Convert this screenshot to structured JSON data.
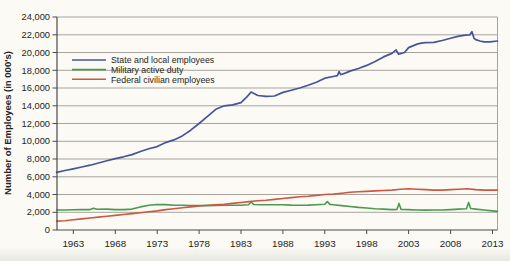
{
  "figure": {
    "title": "",
    "background": "#fbfaf5"
  },
  "chart_data": {
    "type": "line",
    "title": "",
    "xlabel": "",
    "ylabel": "Number of Employees (in 000's)",
    "xlim": [
      1961.05,
      2013.6
    ],
    "ylim": [
      0,
      24000
    ],
    "grid": "horizontal",
    "legend_position": "top-left-inside",
    "x_ticks": [
      1963,
      1968,
      1973,
      1978,
      1983,
      1988,
      1993,
      1998,
      2003,
      2008,
      2013
    ],
    "x_tick_labels": [
      "1963",
      "1968",
      "1973",
      "1978",
      "1983",
      "1988",
      "1993",
      "1998",
      "2003",
      "2008",
      "2013"
    ],
    "y_ticks": [
      0,
      2000,
      4000,
      6000,
      8000,
      10000,
      12000,
      14000,
      16000,
      18000,
      20000,
      22000,
      24000
    ],
    "y_tick_labels": [
      "0",
      "2,000",
      "4,000",
      "6,000",
      "8,000",
      "10,000",
      "12,000",
      "14,000",
      "16,000",
      "18,000",
      "20,000",
      "22,000",
      "24,000"
    ],
    "colors": {
      "grid": "#a8a49d",
      "axis": "#4a4a48",
      "text": "#262422"
    },
    "series": [
      {
        "name": "State and local employees",
        "color": "#47549a",
        "width": 1.7,
        "points": [
          [
            1961,
            6500
          ],
          [
            1962,
            6700
          ],
          [
            1963,
            6900
          ],
          [
            1964,
            7100
          ],
          [
            1965,
            7300
          ],
          [
            1966,
            7550
          ],
          [
            1967,
            7800
          ],
          [
            1968,
            8050
          ],
          [
            1969,
            8250
          ],
          [
            1970,
            8500
          ],
          [
            1971,
            8850
          ],
          [
            1972,
            9150
          ],
          [
            1973,
            9400
          ],
          [
            1974,
            9850
          ],
          [
            1975,
            10150
          ],
          [
            1976,
            10600
          ],
          [
            1977,
            11250
          ],
          [
            1978,
            12000
          ],
          [
            1979,
            12800
          ],
          [
            1980,
            13600
          ],
          [
            1981,
            14000
          ],
          [
            1982,
            14100
          ],
          [
            1983,
            14350
          ],
          [
            1983.7,
            15000
          ],
          [
            1984.2,
            15550
          ],
          [
            1985,
            15150
          ],
          [
            1986,
            15050
          ],
          [
            1987,
            15100
          ],
          [
            1988,
            15500
          ],
          [
            1989,
            15750
          ],
          [
            1990,
            16000
          ],
          [
            1991,
            16300
          ],
          [
            1992,
            16650
          ],
          [
            1993,
            17100
          ],
          [
            1994,
            17300
          ],
          [
            1994.5,
            17400
          ],
          [
            1994.7,
            17850
          ],
          [
            1994.9,
            17500
          ],
          [
            1995.5,
            17700
          ],
          [
            1996,
            17900
          ],
          [
            1997,
            18200
          ],
          [
            1998,
            18550
          ],
          [
            1999,
            19000
          ],
          [
            2000,
            19500
          ],
          [
            2001,
            19900
          ],
          [
            2001.5,
            20300
          ],
          [
            2001.8,
            19800
          ],
          [
            2002.5,
            20000
          ],
          [
            2003,
            20550
          ],
          [
            2004,
            20950
          ],
          [
            2004.5,
            21050
          ],
          [
            2005,
            21100
          ],
          [
            2006,
            21150
          ],
          [
            2007,
            21350
          ],
          [
            2008,
            21600
          ],
          [
            2009,
            21850
          ],
          [
            2009.8,
            21950
          ],
          [
            2010.3,
            22000
          ],
          [
            2010.55,
            22350
          ],
          [
            2010.8,
            21600
          ],
          [
            2011,
            21450
          ],
          [
            2011.5,
            21300
          ],
          [
            2012,
            21200
          ],
          [
            2012.7,
            21200
          ],
          [
            2013.6,
            21300
          ]
        ]
      },
      {
        "name": "Military active duty",
        "color": "#4c9950",
        "width": 1.6,
        "points": [
          [
            1961,
            2250
          ],
          [
            1962,
            2250
          ],
          [
            1963,
            2280
          ],
          [
            1964,
            2300
          ],
          [
            1965,
            2300
          ],
          [
            1965.4,
            2450
          ],
          [
            1965.8,
            2330
          ],
          [
            1967,
            2350
          ],
          [
            1968,
            2300
          ],
          [
            1969,
            2300
          ],
          [
            1970,
            2350
          ],
          [
            1971,
            2600
          ],
          [
            1972,
            2800
          ],
          [
            1973,
            2870
          ],
          [
            1974,
            2860
          ],
          [
            1975,
            2800
          ],
          [
            1976,
            2790
          ],
          [
            1977,
            2760
          ],
          [
            1978,
            2750
          ],
          [
            1979,
            2750
          ],
          [
            1980,
            2760
          ],
          [
            1981,
            2790
          ],
          [
            1982,
            2800
          ],
          [
            1983,
            2800
          ],
          [
            1983.9,
            2850
          ],
          [
            1984.2,
            3150
          ],
          [
            1984.5,
            2870
          ],
          [
            1985.5,
            2850
          ],
          [
            1986,
            2850
          ],
          [
            1987,
            2840
          ],
          [
            1988,
            2850
          ],
          [
            1989,
            2810
          ],
          [
            1990,
            2800
          ],
          [
            1991,
            2810
          ],
          [
            1992,
            2850
          ],
          [
            1993,
            2900
          ],
          [
            1993.3,
            3200
          ],
          [
            1993.6,
            2880
          ],
          [
            1994,
            2850
          ],
          [
            1995,
            2750
          ],
          [
            1996,
            2650
          ],
          [
            1997,
            2550
          ],
          [
            1998,
            2480
          ],
          [
            1999,
            2400
          ],
          [
            2000,
            2350
          ],
          [
            2001,
            2300
          ],
          [
            2001.6,
            2320
          ],
          [
            2001.85,
            3000
          ],
          [
            2002.1,
            2320
          ],
          [
            2003,
            2300
          ],
          [
            2004,
            2250
          ],
          [
            2005,
            2240
          ],
          [
            2006,
            2250
          ],
          [
            2007,
            2250
          ],
          [
            2008,
            2300
          ],
          [
            2009,
            2350
          ],
          [
            2009.9,
            2400
          ],
          [
            2010.15,
            3100
          ],
          [
            2010.4,
            2420
          ],
          [
            2011,
            2350
          ],
          [
            2012,
            2250
          ],
          [
            2013.6,
            2100
          ]
        ]
      },
      {
        "name": "Federal civilian employees",
        "color": "#cd5742",
        "width": 1.6,
        "points": [
          [
            1961,
            1000
          ],
          [
            1962,
            1050
          ],
          [
            1963,
            1150
          ],
          [
            1964,
            1250
          ],
          [
            1965,
            1350
          ],
          [
            1966,
            1450
          ],
          [
            1967,
            1550
          ],
          [
            1968,
            1650
          ],
          [
            1969,
            1750
          ],
          [
            1970,
            1850
          ],
          [
            1971,
            1950
          ],
          [
            1972,
            2050
          ],
          [
            1973,
            2150
          ],
          [
            1974,
            2300
          ],
          [
            1975,
            2400
          ],
          [
            1976,
            2500
          ],
          [
            1977,
            2600
          ],
          [
            1978,
            2700
          ],
          [
            1979,
            2800
          ],
          [
            1980,
            2850
          ],
          [
            1981,
            2900
          ],
          [
            1982,
            3000
          ],
          [
            1983,
            3100
          ],
          [
            1984,
            3200
          ],
          [
            1985,
            3300
          ],
          [
            1986,
            3350
          ],
          [
            1987,
            3450
          ],
          [
            1988,
            3550
          ],
          [
            1989,
            3650
          ],
          [
            1990,
            3750
          ],
          [
            1991,
            3800
          ],
          [
            1992,
            3900
          ],
          [
            1993,
            4000
          ],
          [
            1994,
            4050
          ],
          [
            1995,
            4150
          ],
          [
            1996,
            4250
          ],
          [
            1997,
            4300
          ],
          [
            1998,
            4350
          ],
          [
            1999,
            4400
          ],
          [
            2000,
            4450
          ],
          [
            2001,
            4500
          ],
          [
            2002,
            4600
          ],
          [
            2003,
            4650
          ],
          [
            2004,
            4600
          ],
          [
            2005,
            4550
          ],
          [
            2006,
            4500
          ],
          [
            2007,
            4500
          ],
          [
            2008,
            4550
          ],
          [
            2009,
            4600
          ],
          [
            2010,
            4650
          ],
          [
            2011,
            4550
          ],
          [
            2012,
            4500
          ],
          [
            2013.6,
            4500
          ]
        ]
      }
    ]
  }
}
